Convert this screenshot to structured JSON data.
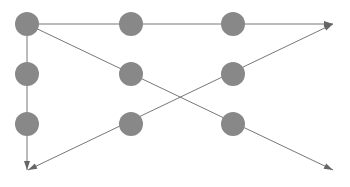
{
  "canvas": {
    "width": 350,
    "height": 187,
    "background": "#ffffff"
  },
  "style": {
    "node_fill": "#888888",
    "node_radius": 12,
    "line_color": "#777777",
    "line_width": 1,
    "arrow_fill": "#666666",
    "arrow_length": 9,
    "arrow_width": 6
  },
  "diagram": {
    "type": "node-link-grid",
    "title": "",
    "node_count": 9,
    "edge_count": 4,
    "nodes": [
      {
        "id": "n-r1c1",
        "label": "",
        "row": 1,
        "col": 1,
        "cx": 27,
        "cy": 24
      },
      {
        "id": "n-r1c2",
        "label": "",
        "row": 1,
        "col": 2,
        "cx": 131,
        "cy": 24
      },
      {
        "id": "n-r1c3",
        "label": "",
        "row": 1,
        "col": 3,
        "cx": 233,
        "cy": 24
      },
      {
        "id": "n-r2c1",
        "label": "",
        "row": 2,
        "col": 1,
        "cx": 27,
        "cy": 74
      },
      {
        "id": "n-r2c2",
        "label": "",
        "row": 2,
        "col": 2,
        "cx": 131,
        "cy": 74
      },
      {
        "id": "n-r2c3",
        "label": "",
        "row": 2,
        "col": 3,
        "cx": 233,
        "cy": 74
      },
      {
        "id": "n-r3c1",
        "label": "",
        "row": 3,
        "col": 1,
        "cx": 27,
        "cy": 124
      },
      {
        "id": "n-r3c2",
        "label": "",
        "row": 3,
        "col": 2,
        "cx": 131,
        "cy": 124
      },
      {
        "id": "n-r3c3",
        "label": "",
        "row": 3,
        "col": 3,
        "cx": 233,
        "cy": 124
      }
    ],
    "edges": [
      {
        "id": "edge-horizontal-top",
        "label": "",
        "orientation": "horizontal",
        "x1": 27,
        "y1": 24,
        "x2": 333,
        "y2": 24,
        "arrow_start": false,
        "arrow_end": true,
        "passes_nodes": [
          "n-r1c1",
          "n-r1c2",
          "n-r1c3"
        ]
      },
      {
        "id": "edge-vertical-left",
        "label": "",
        "orientation": "vertical",
        "x1": 27,
        "y1": 24,
        "x2": 27,
        "y2": 170,
        "arrow_start": false,
        "arrow_end": true,
        "passes_nodes": [
          "n-r1c1",
          "n-r2c1",
          "n-r3c1"
        ]
      },
      {
        "id": "edge-diagonal-descending",
        "label": "",
        "orientation": "diagonal-down-right",
        "x1": 27,
        "y1": 24,
        "x2": 333,
        "y2": 170,
        "arrow_start": false,
        "arrow_end": true,
        "passes_nodes": [
          "n-r1c1",
          "n-r2c2",
          "n-r3c3"
        ]
      },
      {
        "id": "edge-diagonal-ascending",
        "label": "",
        "orientation": "diagonal-up-right",
        "x1": 28,
        "y1": 170,
        "x2": 333,
        "y2": 24,
        "arrow_start": true,
        "arrow_end": true,
        "passes_nodes": [
          "n-r3c1-corner",
          "n-r3c2",
          "n-r2c3"
        ]
      }
    ],
    "crossing_point": {
      "x": 180,
      "y": 99
    },
    "arrow_tips": [
      {
        "id": "arrow-tip-top-right",
        "x": 333,
        "y": 24
      },
      {
        "id": "arrow-tip-bottom-left",
        "x": 28,
        "y": 170
      },
      {
        "id": "arrow-tip-bottom-right",
        "x": 333,
        "y": 170
      }
    ]
  }
}
